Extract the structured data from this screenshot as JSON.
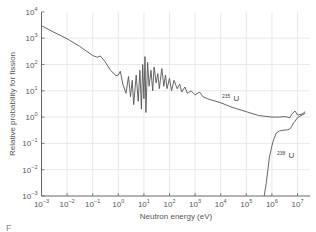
{
  "chart_data": {
    "type": "line",
    "title": "",
    "xlabel": "Neutron energy (eV)",
    "ylabel": "Relative probability for fission",
    "xscale": "log",
    "yscale": "log",
    "xlim": [
      0.001,
      30000000
    ],
    "ylim": [
      0.001,
      10000
    ],
    "grid": true,
    "legend": "inline labels",
    "x_ticks": [
      "10^-3",
      "10^-2",
      "10^-1",
      "10^0",
      "10^1",
      "10^2",
      "10^3",
      "10^4",
      "10^5",
      "10^6",
      "10^7"
    ],
    "y_ticks": [
      "10^-3",
      "10^-2",
      "10^-1",
      "10^0",
      "10^1",
      "10^2",
      "10^3",
      "10^4"
    ],
    "series": [
      {
        "name": "235U",
        "label_base": "U",
        "label_mass": "235",
        "x": [
          0.001,
          0.003,
          0.01,
          0.03,
          0.1,
          0.15,
          0.2,
          0.3,
          0.5,
          0.8,
          1.0,
          1.2,
          1.5,
          2,
          2.5,
          3,
          3.5,
          4,
          5,
          6,
          7,
          8,
          9,
          10,
          11,
          12,
          14,
          16,
          19,
          22,
          25,
          30,
          35,
          40,
          50,
          60,
          70,
          80,
          100,
          120,
          150,
          200,
          250,
          300,
          400,
          500,
          700,
          1000,
          1500,
          2000,
          3000,
          10000,
          30000,
          100000,
          300000,
          1000000,
          2000000,
          3000000,
          4000000,
          5000000,
          6000000,
          8000000,
          10000000,
          15000000,
          20000000
        ],
        "y": [
          3000,
          1700,
          950,
          500,
          220,
          190,
          210,
          130,
          60,
          38,
          40,
          55,
          18,
          8,
          35,
          6,
          25,
          3,
          40,
          4,
          60,
          2,
          100,
          5,
          200,
          1.5,
          120,
          15,
          60,
          10,
          80,
          20,
          45,
          12,
          70,
          15,
          40,
          12,
          30,
          10,
          25,
          12,
          18,
          9,
          14,
          8,
          10,
          7,
          9,
          6,
          5,
          3.5,
          2.3,
          1.6,
          1.15,
          1.0,
          1.0,
          1.05,
          1.0,
          0.95,
          1.3,
          1.7,
          1.2,
          1.3,
          1.6
        ]
      },
      {
        "name": "238U",
        "label_base": "U",
        "label_mass": "238",
        "x": [
          500000,
          600000,
          700000,
          800000,
          1000000,
          1200000,
          1500000,
          2000000,
          3000000,
          4000000,
          5000000,
          6000000,
          7000000,
          8000000,
          10000000,
          15000000,
          20000000
        ],
        "y": [
          0.001,
          0.003,
          0.01,
          0.03,
          0.08,
          0.15,
          0.25,
          0.3,
          0.32,
          0.33,
          0.35,
          0.45,
          0.6,
          0.7,
          0.95,
          1.2,
          1.4
        ]
      }
    ]
  },
  "figure": {
    "caption_fragment": "F"
  }
}
